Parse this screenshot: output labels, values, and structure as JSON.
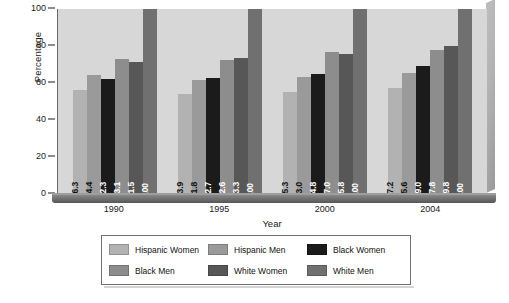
{
  "chart_data": {
    "type": "bar",
    "title": "",
    "subtitle": "",
    "xlabel": "Year",
    "ylabel": "Percentage",
    "categories": [
      "1990",
      "1995",
      "2000",
      "2004"
    ],
    "ylim": [
      0,
      100
    ],
    "yticks": [
      0,
      20,
      40,
      60,
      80,
      100
    ],
    "ytick_labels": [
      "0",
      "20",
      "40",
      "60",
      "80",
      "100"
    ],
    "grid": false,
    "legend_position": "bottom",
    "bar_value_labels": true,
    "series": [
      {
        "name": "Hispanic Women",
        "color": "#b2b2b2",
        "label_color": "#111111",
        "values": [
          56.3,
          53.9,
          55.3,
          57.2
        ],
        "value_labels": [
          "56.3",
          "53.9",
          "55.3",
          "57.2"
        ]
      },
      {
        "name": "Hispanic Men",
        "color": "#9a9a9a",
        "label_color": "#111111",
        "values": [
          64.4,
          61.8,
          63.0,
          65.6
        ],
        "value_labels": [
          "64.4",
          "61.8",
          "63.0",
          "65.6"
        ]
      },
      {
        "name": "Black Women",
        "color": "#1b1b1b",
        "label_color": "#ffffff",
        "values": [
          62.3,
          62.7,
          64.8,
          69.0
        ],
        "value_labels": [
          "62.3",
          "62.7",
          "64.8",
          "69.0"
        ]
      },
      {
        "name": "Black Men",
        "color": "#8d8d8d",
        "label_color": "#ffffff",
        "values": [
          73.1,
          72.6,
          77.0,
          77.8
        ],
        "value_labels": [
          "73.1",
          "72.6",
          "77.0",
          "77.8"
        ]
      },
      {
        "name": "White Women",
        "color": "#575757",
        "label_color": "#ffffff",
        "values": [
          71.5,
          73.3,
          75.8,
          79.8
        ],
        "value_labels": [
          "71.5",
          "73.3",
          "75.8",
          "79.8"
        ]
      },
      {
        "name": "White Men",
        "color": "#707070",
        "label_color": "#ffffff",
        "values": [
          100,
          100,
          100,
          100
        ],
        "value_labels": [
          "100",
          "100",
          "100",
          "100"
        ]
      }
    ],
    "legend": [
      "Hispanic Women",
      "Hispanic Men",
      "Black Women",
      "Black Men",
      "White Women",
      "White Men"
    ]
  },
  "style": {
    "plot_background": "#d7d7d7",
    "figure_background": "#ffffff",
    "axis_color": "#1a1a1a",
    "legend_border": "#707070"
  }
}
